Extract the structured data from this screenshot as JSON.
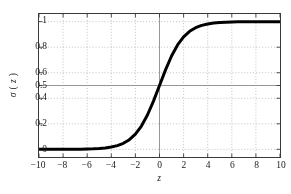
{
  "chart_data": {
    "type": "line",
    "title": "",
    "subtitle": "",
    "xlabel": "z",
    "ylabel": "σ ( z )",
    "ylabel_parts": {
      "sigma": "σ",
      "open": "(",
      "variable": "z",
      "close": ")"
    },
    "xlim": [
      -10,
      10
    ],
    "ylim": [
      -0.06,
      1.06
    ],
    "grid": true,
    "grid_style": "dotted",
    "legend": null,
    "legend_position": "none",
    "xticks": [
      -10,
      -8,
      -6,
      -4,
      -2,
      0,
      2,
      4,
      6,
      8,
      10
    ],
    "xticklabels": [
      "−10",
      "−8",
      "−6",
      "−4",
      "−2",
      "0",
      "2",
      "4",
      "6",
      "8",
      "10"
    ],
    "yticks": [
      0,
      0.2,
      0.4,
      0.5,
      0.6,
      0.8,
      1
    ],
    "yticklabels": [
      "0",
      "0.2",
      "0.4",
      "0.5",
      "0.6",
      "0.8",
      "1"
    ],
    "reference_lines": [
      {
        "axis": "y",
        "value": 0.5,
        "style": "solid",
        "color": "#8c8c8c"
      },
      {
        "axis": "x",
        "value": 0,
        "style": "solid",
        "color": "#8c8c8c"
      }
    ],
    "series": [
      {
        "name": "sigma(z)",
        "formula": "1 / (1 + exp(-z))",
        "color": "#000000",
        "linewidth": 3,
        "x": [
          -10,
          -9.5,
          -9,
          -8.5,
          -8,
          -7.5,
          -7,
          -6.5,
          -6,
          -5.5,
          -5,
          -4.5,
          -4,
          -3.5,
          -3,
          -2.5,
          -2,
          -1.5,
          -1,
          -0.5,
          0,
          0.5,
          1,
          1.5,
          2,
          2.5,
          3,
          3.5,
          4,
          4.5,
          5,
          5.5,
          6,
          6.5,
          7,
          7.5,
          8,
          8.5,
          9,
          9.5,
          10
        ],
        "values": [
          4.54e-05,
          7.49e-05,
          0.0001234,
          0.0002035,
          0.0003354,
          0.0005527,
          0.0009111,
          0.0015012,
          0.0024726,
          0.0040701,
          0.0066929,
          0.0109869,
          0.0179862,
          0.0293122,
          0.0474259,
          0.0758582,
          0.1192029,
          0.1824255,
          0.2689414,
          0.3775407,
          0.5,
          0.6224593,
          0.7310586,
          0.8175745,
          0.8807971,
          0.9241418,
          0.9525741,
          0.9706877,
          0.9820138,
          0.9890131,
          0.9933071,
          0.9959299,
          0.9975274,
          0.9984988,
          0.9990889,
          0.9994473,
          0.9996646,
          0.9997965,
          0.9998766,
          0.9999251,
          0.9999546
        ]
      }
    ],
    "colors": {
      "curve": "#000000",
      "frame": "#3a3a3a",
      "grid": "#b0b0b0",
      "reference": "#8c8c8c",
      "text": "#1a1a1a",
      "background": "#ffffff"
    }
  }
}
